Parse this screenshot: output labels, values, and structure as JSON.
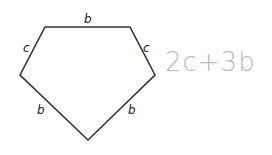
{
  "diagram": {
    "shape": "pentagon",
    "vertices": [
      [
        45,
        27
      ],
      [
        130,
        27
      ],
      [
        155,
        75
      ],
      [
        88,
        140
      ],
      [
        20,
        75
      ]
    ],
    "stroke_color": "#333333",
    "edge_labels": {
      "top": "b",
      "upper_left": "c",
      "upper_right": "c",
      "lower_left": "b",
      "lower_right": "b"
    }
  },
  "handwritten_answer": {
    "text": "2c+3b",
    "color": "#b8b8b8"
  }
}
